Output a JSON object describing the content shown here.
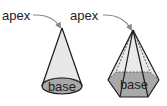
{
  "diagram": {
    "cone": {
      "apex_label": "apex",
      "base_label": "base"
    },
    "pyramid": {
      "apex_label": "apex",
      "base_label": "base"
    }
  },
  "colors": {
    "lateral_fill": "#e6e6e6",
    "base_fill": "#a8a8a8",
    "stroke": "#1a1a1a",
    "arrow": "#888888"
  }
}
